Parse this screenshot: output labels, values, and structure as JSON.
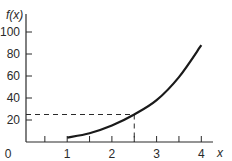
{
  "chart_data": {
    "type": "line",
    "title": "",
    "xlabel": "x",
    "ylabel": "f(x)",
    "xlim": [
      0,
      4.25
    ],
    "ylim": [
      0,
      110
    ],
    "x_ticks": [
      0.5,
      1,
      1.5,
      2,
      2.5,
      3,
      3.5,
      4
    ],
    "x_tick_labels": [
      "0",
      "1",
      "2",
      "3",
      "4"
    ],
    "x_labeled_values": [
      0,
      1,
      2,
      3,
      4
    ],
    "y_ticks": [
      20,
      40,
      60,
      80,
      100
    ],
    "y_tick_labels": [
      "20",
      "40",
      "60",
      "80",
      "100"
    ],
    "grid": false,
    "legend": null,
    "series": [
      {
        "name": "f(x)",
        "x": [
          1,
          1.5,
          2,
          2.5,
          3,
          3.5,
          4
        ],
        "y": [
          4,
          8,
          15,
          25,
          38,
          59,
          88
        ]
      }
    ],
    "annotations": [
      {
        "type": "dashed-guide",
        "x": 2.5,
        "y": 25,
        "description": "dashed lines from y-axis at f=25 to curve and down to x=2.5"
      }
    ]
  },
  "labels": {
    "y_axis": "f(x)",
    "x_axis": "x",
    "origin": "0"
  },
  "colors": {
    "curve": "#1a1a1a",
    "axis": "#2a2a2a",
    "background": "#ffffff"
  }
}
